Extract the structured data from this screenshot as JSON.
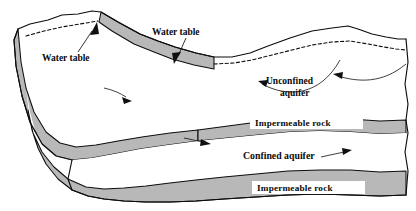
{
  "figure": {
    "background_color": "#ffffff",
    "rock_fill_color": "#b8b8b8",
    "line_color": "#0d0d0d",
    "aquifer_fill_color": "#ffffff"
  },
  "labels": {
    "water_table_left": "Water table",
    "water_table_right": "Water table",
    "unconfined_aquifer_line1": "Unconfined",
    "unconfined_aquifer_line2": "aquifer",
    "impermeable_rock_upper": "Impermeable  rock",
    "confined_aquifer": "Confined aquifer",
    "impermeable_rock_lower": "Impermeable  rock"
  },
  "icons": {
    "flow_arrow_upper": "arrow-down-right-icon",
    "flow_arrow_middle": "arrow-right-icon",
    "leader_arrow_water_table_left": "arrow-up-right-icon",
    "leader_arrow_water_table_right": "arrow-down-left-icon",
    "recharge_arrow_left": "arrow-left-icon",
    "recharge_arrow_right": "arrow-left-icon",
    "confined_flow_arrow": "arrow-right-icon"
  }
}
